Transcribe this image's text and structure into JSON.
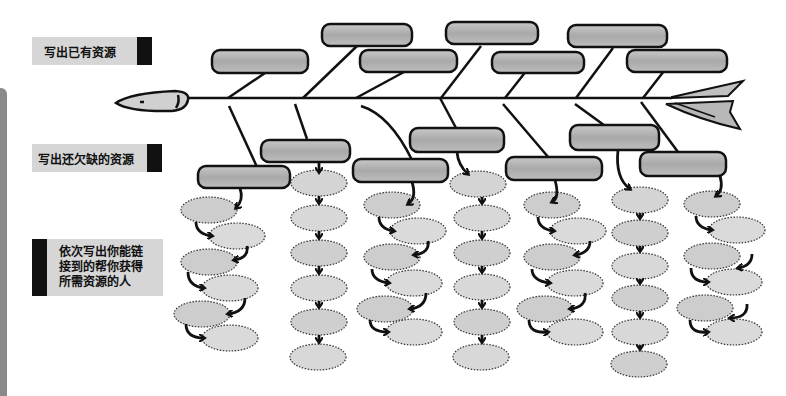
{
  "labels": {
    "existing_resources": "写出已有资源",
    "missing_resources": "写出还欠缺的资源",
    "people_chain": "依次写出你能链接到的帮你获得所需资源的人"
  },
  "colors": {
    "box_fill": "#b5b5b5",
    "oval_fill": "#d4d4d4",
    "label_bg": "#d6d6d6",
    "stroke": "#111111"
  },
  "diagram": {
    "type": "fishbone",
    "top_boxes": 7,
    "bottom_boxes": 7,
    "oval_columns": [
      {
        "count": 6,
        "style": "zigzag"
      },
      {
        "count": 6,
        "style": "straight"
      },
      {
        "count": 6,
        "style": "zigzag"
      },
      {
        "count": 6,
        "style": "straight"
      },
      {
        "count": 6,
        "style": "zigzag"
      },
      {
        "count": 6,
        "style": "straight"
      },
      {
        "count": 6,
        "style": "zigzag"
      }
    ]
  }
}
